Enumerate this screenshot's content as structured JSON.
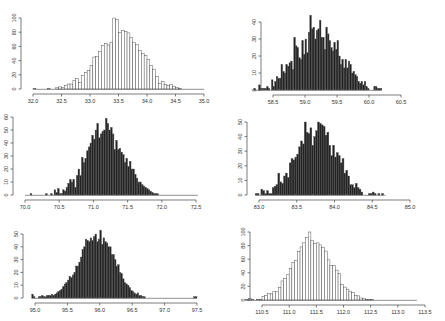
{
  "chart_data": [
    {
      "id": "top-left",
      "type": "bar",
      "fill": "#ffffff",
      "stroke": "#333333",
      "title": "",
      "xlabel": "",
      "ylabel": "",
      "xticks": [
        "32.0",
        "32.5",
        "33.0",
        "33.5",
        "34.0",
        "34.5",
        "35.0"
      ],
      "xtick_values": [
        32.0,
        32.5,
        33.0,
        33.5,
        34.0,
        34.5,
        35.0
      ],
      "yticks": [
        "0",
        "20",
        "40",
        "60",
        "80",
        "100"
      ],
      "ytick_values": [
        0,
        20,
        40,
        60,
        80,
        100
      ],
      "xlim": [
        32.0,
        35.0
      ],
      "ylim": [
        0,
        100
      ],
      "px": {
        "x0": 33,
        "x1": 204,
        "y0": 89,
        "y1": 18
      },
      "bin_start": 32.0,
      "bin_width": 0.05,
      "values": [
        1,
        0,
        0,
        0,
        0,
        1,
        0,
        0,
        2,
        3,
        2,
        5,
        7,
        7,
        12,
        15,
        9,
        19,
        23,
        26,
        33,
        45,
        46,
        53,
        61,
        64,
        62,
        66,
        100,
        98,
        80,
        82,
        81,
        79,
        73,
        66,
        63,
        54,
        50,
        47,
        42,
        33,
        28,
        18,
        8,
        11,
        6,
        5,
        6,
        4,
        2,
        1,
        0,
        0,
        0,
        0,
        0,
        0,
        0,
        0
      ]
    },
    {
      "id": "top-right",
      "type": "bar",
      "fill": "#222222",
      "stroke": "#555555",
      "title": "",
      "xlabel": "",
      "ylabel": "",
      "xticks": [
        "58.5",
        "59.0",
        "59.5",
        "60.0",
        "60.5"
      ],
      "xtick_values": [
        58.5,
        59.0,
        59.5,
        60.0,
        60.5
      ],
      "yticks": [
        "0",
        "10",
        "20",
        "30",
        "40"
      ],
      "ytick_values": [
        0,
        10,
        20,
        30,
        40
      ],
      "xlim": [
        58.5,
        60.5
      ],
      "ylim": [
        0,
        40
      ],
      "px": {
        "x0": 273,
        "x1": 401,
        "y0": 90,
        "y1": 22
      },
      "bin_start": 58.2,
      "bin_width": 0.025,
      "values": [
        1,
        0,
        0,
        3,
        1,
        1,
        1,
        1,
        2,
        1,
        0,
        6,
        2,
        5,
        8,
        7,
        7,
        15,
        11,
        10,
        15,
        14,
        16,
        17,
        12,
        31,
        26,
        25,
        19,
        18,
        29,
        21,
        30,
        22,
        34,
        44,
        36,
        37,
        30,
        35,
        36,
        41,
        31,
        31,
        24,
        37,
        33,
        29,
        25,
        23,
        28,
        24,
        29,
        20,
        15,
        18,
        13,
        18,
        13,
        17,
        15,
        10,
        11,
        9,
        8,
        5,
        4,
        5,
        3,
        5,
        2,
        1,
        0,
        0,
        0,
        2,
        2,
        1,
        1,
        1
      ]
    },
    {
      "id": "middle-left",
      "type": "bar",
      "fill": "#222222",
      "stroke": "#555555",
      "title": "",
      "xlabel": "",
      "ylabel": "",
      "xticks": [
        "70.0",
        "70.5",
        "71.0",
        "71.5",
        "72.0",
        "72.5"
      ],
      "xtick_values": [
        70.0,
        70.5,
        71.0,
        71.5,
        72.0,
        72.5
      ],
      "yticks": [
        "0",
        "10",
        "20",
        "30",
        "40",
        "50",
        "60"
      ],
      "ytick_values": [
        0,
        10,
        20,
        30,
        40,
        50,
        60
      ],
      "xlim": [
        70.0,
        72.5
      ],
      "ylim": [
        0,
        60
      ],
      "px": {
        "x0": 25,
        "x1": 196,
        "y0": 195,
        "y1": 117
      },
      "bin_start": 70.0,
      "bin_width": 0.025,
      "values": [
        0,
        0,
        0,
        1,
        0,
        0,
        0,
        0,
        0,
        0,
        0,
        0,
        1,
        0,
        0,
        1,
        0,
        4,
        2,
        5,
        1,
        1,
        4,
        3,
        6,
        9,
        12,
        10,
        12,
        6,
        15,
        20,
        15,
        29,
        25,
        28,
        34,
        37,
        40,
        46,
        43,
        50,
        55,
        44,
        47,
        49,
        50,
        59,
        55,
        50,
        52,
        47,
        35,
        42,
        35,
        36,
        33,
        31,
        25,
        28,
        22,
        26,
        20,
        20,
        16,
        13,
        10,
        10,
        8,
        7,
        6,
        5,
        4,
        3,
        2,
        1,
        1,
        1,
        0,
        0,
        0,
        0,
        0,
        0,
        0,
        0,
        0,
        0,
        0,
        0,
        0,
        0,
        0,
        0,
        0,
        0,
        0,
        0,
        0,
        0,
        0
      ]
    },
    {
      "id": "middle-right",
      "type": "bar",
      "fill": "#222222",
      "stroke": "#555555",
      "title": "",
      "xlabel": "",
      "ylabel": "",
      "xticks": [
        "83.0",
        "83.5",
        "84.0",
        "84.5",
        "85.0"
      ],
      "xtick_values": [
        83.0,
        83.5,
        84.0,
        84.5,
        85.0
      ],
      "yticks": [
        "0",
        "10",
        "20",
        "30",
        "40",
        "50"
      ],
      "ytick_values": [
        0,
        10,
        20,
        30,
        40,
        50
      ],
      "xlim": [
        83.0,
        85.0
      ],
      "ylim": [
        0,
        50
      ],
      "px": {
        "x0": 259,
        "x1": 410,
        "y0": 195,
        "y1": 122
      },
      "bin_start": 82.95,
      "bin_width": 0.025,
      "values": [
        1,
        1,
        0,
        4,
        3,
        1,
        3,
        1,
        1,
        5,
        6,
        7,
        15,
        9,
        8,
        13,
        15,
        12,
        22,
        25,
        24,
        26,
        28,
        33,
        37,
        35,
        50,
        43,
        42,
        46,
        34,
        40,
        44,
        50,
        49,
        48,
        47,
        41,
        43,
        34,
        27,
        34,
        26,
        29,
        27,
        22,
        25,
        15,
        17,
        13,
        7,
        7,
        5,
        8,
        5,
        4,
        2,
        0,
        0,
        0,
        1,
        1,
        2,
        1,
        0,
        1,
        0,
        1,
        0
      ]
    },
    {
      "id": "bottom-left",
      "type": "bar",
      "fill": "#222222",
      "stroke": "#555555",
      "title": "",
      "xlabel": "",
      "ylabel": "",
      "xticks": [
        "95.0",
        "95.5",
        "96.0",
        "96.5",
        "97.0",
        "97.5"
      ],
      "xtick_values": [
        95.0,
        95.5,
        96.0,
        96.5,
        97.0,
        97.5
      ],
      "yticks": [
        "0",
        "10",
        "20",
        "30",
        "40",
        "50"
      ],
      "ytick_values": [
        0,
        10,
        20,
        30,
        40,
        50
      ],
      "xlim": [
        95.0,
        97.5
      ],
      "ylim": [
        0,
        50
      ],
      "px": {
        "x0": 35,
        "x1": 197,
        "y0": 298,
        "y1": 234
      },
      "bin_start": 94.95,
      "bin_width": 0.025,
      "values": [
        3,
        1,
        0,
        0,
        1,
        1,
        2,
        1,
        1,
        2,
        2,
        2,
        3,
        2,
        3,
        4,
        5,
        6,
        7,
        9,
        11,
        12,
        14,
        17,
        16,
        18,
        20,
        25,
        25,
        28,
        32,
        38,
        40,
        46,
        45,
        44,
        47,
        45,
        48,
        50,
        44,
        46,
        53,
        42,
        47,
        44,
        43,
        40,
        40,
        34,
        34,
        30,
        25,
        26,
        20,
        19,
        15,
        12,
        11,
        10,
        8,
        6,
        5,
        4,
        3,
        4,
        2,
        2,
        1,
        1,
        0,
        0,
        0,
        0,
        0,
        0,
        0,
        0,
        0,
        0,
        0,
        0,
        0,
        0,
        0,
        0,
        0,
        0,
        0,
        0,
        0,
        0,
        0,
        0,
        0,
        0,
        0,
        0,
        0,
        0,
        1,
        1
      ]
    },
    {
      "id": "bottom-right",
      "type": "bar",
      "fill": "#ffffff",
      "stroke": "#333333",
      "title": "",
      "xlabel": "",
      "ylabel": "",
      "xticks": [
        "110.5",
        "111.0",
        "111.5",
        "112.0",
        "112.5",
        "113.0",
        "113.5"
      ],
      "xtick_values": [
        110.5,
        111.0,
        111.5,
        112.0,
        112.5,
        113.0,
        113.5
      ],
      "yticks": [
        "0",
        "20",
        "40",
        "60",
        "80",
        "100"
      ],
      "ytick_values": [
        0,
        20,
        40,
        60,
        80,
        100
      ],
      "xlim": [
        110.5,
        113.5
      ],
      "ylim": [
        0,
        100
      ],
      "px": {
        "x0": 262,
        "x1": 425,
        "y0": 300,
        "y1": 232
      },
      "bin_start": 110.2,
      "bin_width": 0.05,
      "values": [
        1,
        2,
        1,
        0,
        1,
        1,
        5,
        7,
        10,
        9,
        13,
        12,
        18,
        28,
        32,
        37,
        46,
        55,
        58,
        71,
        78,
        84,
        92,
        100,
        88,
        83,
        84,
        81,
        77,
        72,
        59,
        51,
        51,
        44,
        39,
        23,
        19,
        16,
        13,
        11,
        7,
        6,
        3,
        2,
        1,
        1,
        1,
        0,
        0,
        0,
        0,
        0,
        0,
        0,
        0,
        0,
        0,
        0,
        0,
        0,
        0,
        0,
        0
      ]
    }
  ]
}
